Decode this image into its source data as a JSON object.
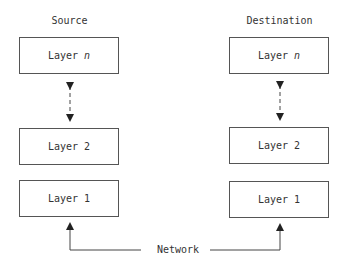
{
  "diagram": {
    "type": "layered-protocol-stack",
    "columns": [
      {
        "title": "Source",
        "layers": [
          {
            "label": "Layer",
            "suffix": "n"
          },
          {
            "label": "Layer 2",
            "suffix": ""
          },
          {
            "label": "Layer 1",
            "suffix": ""
          }
        ]
      },
      {
        "title": "Destination",
        "layers": [
          {
            "label": "Layer",
            "suffix": "n"
          },
          {
            "label": "Layer 2",
            "suffix": ""
          },
          {
            "label": "Layer 1",
            "suffix": ""
          }
        ]
      }
    ],
    "connections": [
      {
        "from": "Source.Layer n",
        "to": "Source.Layer 2",
        "style": "dashed",
        "arrows": "both"
      },
      {
        "from": "Destination.Layer n",
        "to": "Destination.Layer 2",
        "style": "dashed",
        "arrows": "both"
      },
      {
        "from": "Network",
        "to": "Source.Layer 1",
        "style": "solid",
        "arrows": "end"
      },
      {
        "from": "Network",
        "to": "Destination.Layer 1",
        "style": "solid",
        "arrows": "end"
      }
    ],
    "network_label": "Network",
    "colors": {
      "line": "#333333",
      "box_border": "#555555",
      "text": "#333333",
      "background": "#ffffff"
    }
  }
}
